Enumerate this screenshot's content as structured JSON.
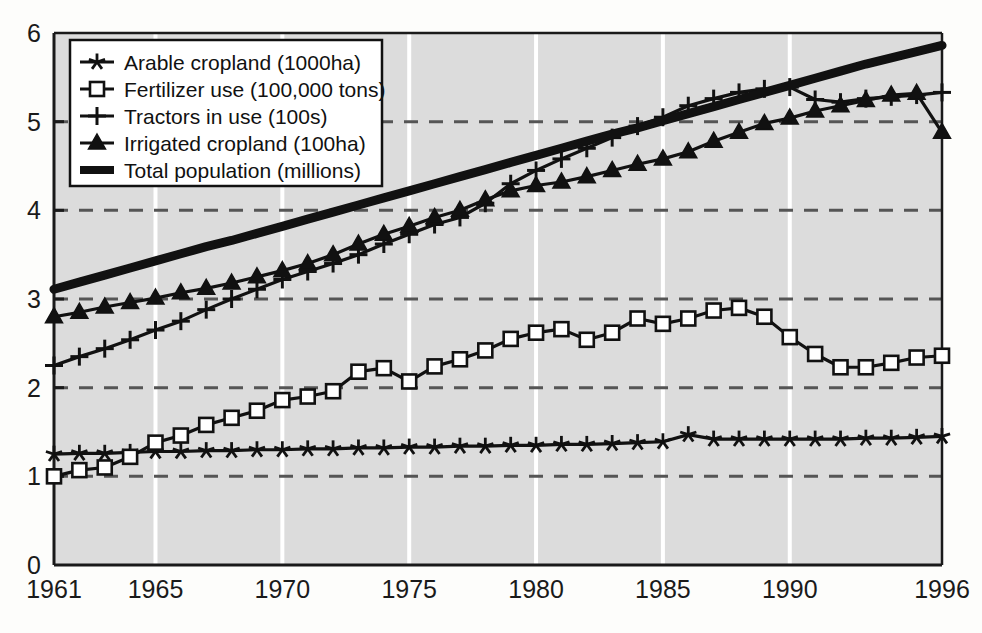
{
  "chart_data": {
    "type": "line",
    "title": "",
    "subtitle": "",
    "xlabel": "",
    "ylabel": "",
    "xlim": [
      1961,
      1996
    ],
    "ylim": [
      0,
      6
    ],
    "yticks": [
      0,
      1,
      2,
      3,
      4,
      5,
      6
    ],
    "ytick_labels": [
      "0",
      "1",
      "2",
      "3",
      "4",
      "5",
      "6"
    ],
    "xticks": [
      1961,
      1965,
      1970,
      1975,
      1980,
      1985,
      1990,
      1996
    ],
    "xtick_labels": [
      "1961",
      "1965",
      "1970",
      "1975",
      "1980",
      "1985",
      "1990",
      "1996"
    ],
    "grid": "horizontal dashed at 1,2,3,4,5; vertical white at 1965,1970,1975,1980,1985,1990",
    "plot_background": "#dcdcdc",
    "legend_position": "top-left inside plot",
    "x": [
      1961,
      1962,
      1963,
      1964,
      1965,
      1966,
      1967,
      1968,
      1969,
      1970,
      1971,
      1972,
      1973,
      1974,
      1975,
      1976,
      1977,
      1978,
      1979,
      1980,
      1981,
      1982,
      1983,
      1984,
      1985,
      1986,
      1987,
      1988,
      1989,
      1990,
      1991,
      1992,
      1993,
      1994,
      1995,
      1996
    ],
    "series": [
      {
        "name": "Arable cropland (1000ha)",
        "marker": "star",
        "values": [
          1.25,
          1.26,
          1.26,
          1.27,
          1.28,
          1.28,
          1.29,
          1.29,
          1.3,
          1.3,
          1.31,
          1.31,
          1.32,
          1.32,
          1.33,
          1.33,
          1.34,
          1.34,
          1.35,
          1.35,
          1.36,
          1.36,
          1.37,
          1.38,
          1.39,
          1.47,
          1.42,
          1.42,
          1.42,
          1.42,
          1.42,
          1.42,
          1.43,
          1.43,
          1.44,
          1.45
        ]
      },
      {
        "name": "Fertilizer use (100,000 tons)",
        "marker": "open-square",
        "values": [
          1.0,
          1.07,
          1.1,
          1.22,
          1.38,
          1.46,
          1.58,
          1.66,
          1.74,
          1.86,
          1.9,
          1.96,
          2.18,
          2.22,
          2.07,
          2.24,
          2.32,
          2.42,
          2.55,
          2.62,
          2.66,
          2.54,
          2.62,
          2.78,
          2.72,
          2.78,
          2.87,
          2.9,
          2.8,
          2.57,
          2.38,
          2.23,
          2.23,
          2.28,
          2.34,
          2.36
        ]
      },
      {
        "name": "Tractors in use (100s)",
        "marker": "plus",
        "values": [
          2.25,
          2.35,
          2.44,
          2.54,
          2.65,
          2.75,
          2.88,
          3.0,
          3.11,
          3.22,
          3.31,
          3.4,
          3.5,
          3.62,
          3.73,
          3.84,
          3.92,
          4.08,
          4.3,
          4.45,
          4.58,
          4.7,
          4.82,
          4.95,
          5.05,
          5.18,
          5.26,
          5.33,
          5.37,
          5.39,
          5.25,
          5.22,
          5.26,
          5.28,
          5.3,
          5.33
        ]
      },
      {
        "name": "Irrigated cropland (100ha)",
        "marker": "triangle",
        "values": [
          2.8,
          2.85,
          2.91,
          2.96,
          3.01,
          3.07,
          3.12,
          3.18,
          3.25,
          3.32,
          3.4,
          3.5,
          3.62,
          3.73,
          3.82,
          3.92,
          4.0,
          4.12,
          4.22,
          4.28,
          4.32,
          4.38,
          4.45,
          4.52,
          4.58,
          4.66,
          4.78,
          4.88,
          4.98,
          5.04,
          5.12,
          5.18,
          5.24,
          5.3,
          5.32,
          4.88
        ]
      },
      {
        "name": "Total population (millions)",
        "marker": "thick-line",
        "values": [
          3.11,
          3.19,
          3.27,
          3.35,
          3.43,
          3.51,
          3.59,
          3.66,
          3.74,
          3.82,
          3.9,
          3.98,
          4.06,
          4.14,
          4.22,
          4.3,
          4.38,
          4.46,
          4.54,
          4.62,
          4.7,
          4.78,
          4.86,
          4.93,
          5.01,
          5.09,
          5.17,
          5.25,
          5.33,
          5.41,
          5.49,
          5.57,
          5.65,
          5.72,
          5.79,
          5.86
        ]
      }
    ]
  },
  "legend": {
    "items": [
      {
        "label": "Arable cropland (1000ha)",
        "marker": "star"
      },
      {
        "label": "Fertilizer use (100,000 tons)",
        "marker": "open-square"
      },
      {
        "label": "Tractors in use (100s)",
        "marker": "plus"
      },
      {
        "label": "Irrigated cropland (100ha)",
        "marker": "triangle"
      },
      {
        "label": "Total population (millions)",
        "marker": "thick-line"
      }
    ]
  },
  "axis": {
    "y_labels": [
      "6",
      "5",
      "4",
      "3",
      "2",
      "1",
      "0"
    ],
    "x_labels": [
      "1961",
      "1965",
      "1970",
      "1975",
      "1980",
      "1985",
      "1990",
      "1996"
    ]
  },
  "colors": {
    "plot_bg": "#dcdcdc",
    "page_bg": "#fdfdfb",
    "line": "#111111",
    "grid_dashed": "#555555",
    "grid_vertical": "#ffffff",
    "axis": "#1a1a1a"
  }
}
